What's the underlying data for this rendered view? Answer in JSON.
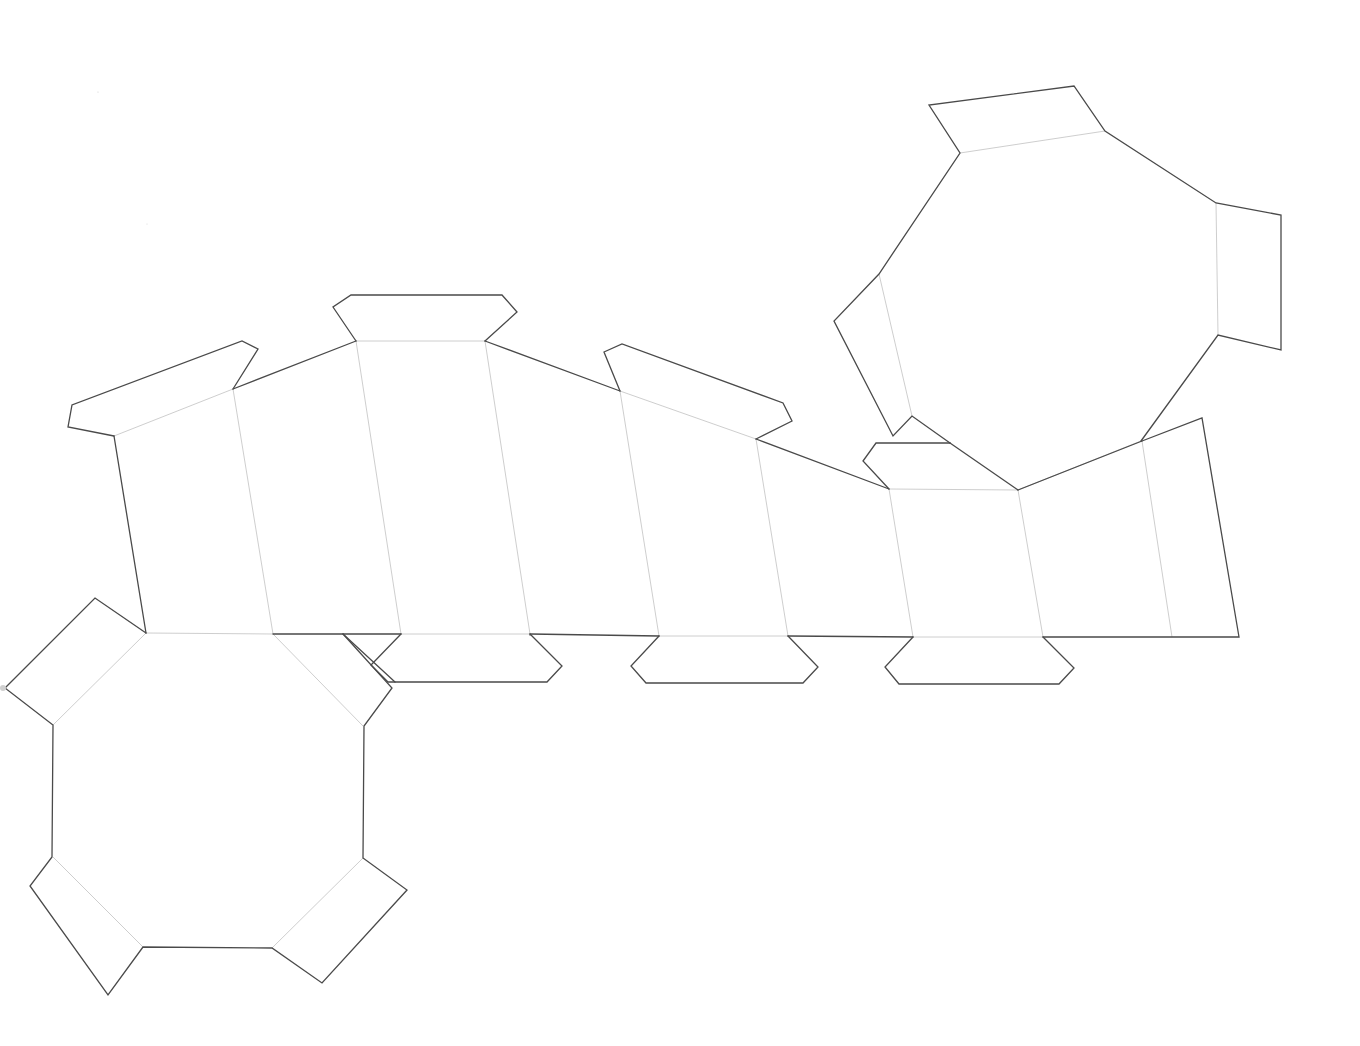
{
  "diagram": {
    "type": "papercraft-net",
    "colors": {
      "background": "#ffffff",
      "cut_line": "#4a4a4a",
      "fold_line": "#c8c8c8"
    },
    "cut_lines": [
      {
        "name": "side-strip-top-left-tab",
        "points": "114,436 68,427 72,405 242,341 258,349 233,389"
      },
      {
        "name": "side-strip-top-edge-1",
        "points": "233,389 356,341"
      },
      {
        "name": "side-strip-top-center-tab",
        "points": "356,341 333,307 351,295 502,295 517,312 485,341"
      },
      {
        "name": "side-strip-top-edge-2",
        "points": "485,341 620,391"
      },
      {
        "name": "side-strip-top-tab-3",
        "points": "620,391 604,352 622,344 783,403 792,421 756,439"
      },
      {
        "name": "side-strip-top-edge-3",
        "points": "756,439 889,489"
      },
      {
        "name": "side-strip-top-tab-4",
        "points": "889,489 863,461 876,443 950,443"
      },
      {
        "name": "side-strip-top-edge-4",
        "points": "950,443 1018,490"
      },
      {
        "name": "side-strip-top-edge-5",
        "points": "1018,490 1142,441"
      },
      {
        "name": "side-strip-right-end",
        "points": "1142,441 1202,418 1239,637 1043,637"
      },
      {
        "name": "side-strip-left-end",
        "points": "114,436 146,633"
      },
      {
        "name": "side-strip-bottom-edge-1",
        "points": "273,634 401,634"
      },
      {
        "name": "side-strip-bottom-tab-1",
        "points": "401,634 371,665 388,682 547,682 562,666 530,634"
      },
      {
        "name": "side-strip-bottom-tab-1-overlap",
        "points": "343,634 395,682"
      },
      {
        "name": "side-strip-bottom-edge-2",
        "points": "530,634 659,636"
      },
      {
        "name": "side-strip-bottom-edge-3",
        "points": "530,635 530,635"
      },
      {
        "name": "side-strip-bottom-tab-2",
        "points": "659,636 631,666 646,683 803,683 818,667 788,636"
      },
      {
        "name": "side-strip-bottom-edge-4",
        "points": "788,636 913,637"
      },
      {
        "name": "side-strip-bottom-tab-3",
        "points": "913,637 885,667 899,684 1059,684 1074,668 1043,637"
      },
      {
        "name": "octagon-bottom-left-edges",
        "points": "146,633 95,598 5,688 53,725 52,857 30,886 108,995 143,947 272,948 322,983 407,890 363,858 364,726 392,688 343,634"
      },
      {
        "name": "octagon-top-right-edges",
        "points": "1141,441 1218,335 1281,350 1281,215 1216,203 1105,131 1074,86 929,105 960,153 879,274 834,321 893,436 912,416 950,443"
      }
    ],
    "fold_lines": [
      {
        "name": "fold-tab-top-left",
        "points": "114,436 233,389"
      },
      {
        "name": "fold-side-1",
        "points": "233,389 273,634"
      },
      {
        "name": "fold-tab-top-center",
        "points": "356,341 485,341"
      },
      {
        "name": "fold-side-2",
        "points": "356,341 401,634"
      },
      {
        "name": "fold-side-3",
        "points": "485,341 530,634"
      },
      {
        "name": "fold-tab-top-3",
        "points": "620,391 756,439"
      },
      {
        "name": "fold-side-4",
        "points": "620,391 659,636"
      },
      {
        "name": "fold-side-5",
        "points": "756,439 788,636"
      },
      {
        "name": "fold-tab-top-4",
        "points": "889,489 1018,490"
      },
      {
        "name": "fold-side-6",
        "points": "889,489 913,637"
      },
      {
        "name": "fold-side-7",
        "points": "1018,490 1043,637"
      },
      {
        "name": "fold-side-8",
        "points": "1142,441 1172,637"
      },
      {
        "name": "fold-bottom-octagon-top",
        "points": "146,633 273,634"
      },
      {
        "name": "fold-bottom-tab-1",
        "points": "401,634 530,634"
      },
      {
        "name": "fold-bottom-tab-2",
        "points": "659,636 788,636"
      },
      {
        "name": "fold-bottom-tab-3",
        "points": "913,637 1043,637"
      },
      {
        "name": "fold-oct-bl-nw",
        "points": "146,633 53,725"
      },
      {
        "name": "fold-oct-bl-ne",
        "points": "273,634 363,726"
      },
      {
        "name": "fold-oct-bl-sw",
        "points": "53,857 143,947"
      },
      {
        "name": "fold-oct-bl-se",
        "points": "363,858 272,948"
      },
      {
        "name": "fold-oct-tr-top",
        "points": "960,153 1105,131"
      },
      {
        "name": "fold-oct-tr-right",
        "points": "1216,203 1218,335"
      },
      {
        "name": "fold-oct-tr-left",
        "points": "879,274 912,416"
      },
      {
        "name": "fold-oct-tr-bottom",
        "points": "1018,490 1141,441"
      }
    ],
    "specks": [
      {
        "cx": 3,
        "cy": 688,
        "r": 3
      },
      {
        "cx": 98,
        "cy": 92,
        "r": 0.6
      },
      {
        "cx": 1013,
        "cy": 93,
        "r": 0.6
      },
      {
        "cx": 147,
        "cy": 224,
        "r": 0.5
      }
    ]
  }
}
